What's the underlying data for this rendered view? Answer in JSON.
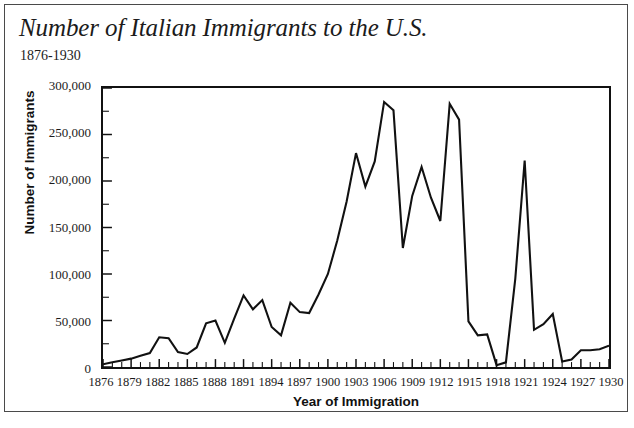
{
  "chart_data": {
    "type": "line",
    "title": "Number of Italian Immigrants to the U.S.",
    "subtitle": "1876-1930",
    "xlabel": "Year of Immigration",
    "ylabel": "Number of Immigrants",
    "xlim": [
      1876,
      1930
    ],
    "ylim": [
      0,
      300000
    ],
    "grid": false,
    "legend": null,
    "line_color": "#111111",
    "frame_color": "#111111",
    "background_color": "#ffffff",
    "y_ticks": [
      0,
      50000,
      100000,
      150000,
      200000,
      250000,
      300000
    ],
    "y_tick_labels": [
      "0",
      "50,000",
      "100,000",
      "150,000",
      "200,000",
      "250,000",
      "300,000"
    ],
    "y_minor_tick_interval": 25000,
    "x_tick_labels": [
      "1876",
      "1879",
      "1882",
      "1885",
      "1888",
      "1891",
      "1894",
      "1897",
      "1900",
      "1903",
      "1906",
      "1909",
      "1912",
      "1915",
      "1918",
      "1921",
      "1924",
      "1927",
      "1930"
    ],
    "x_tick_interval": 3,
    "x_minor_tick_interval": 1,
    "x": [
      1876,
      1877,
      1878,
      1879,
      1880,
      1881,
      1882,
      1883,
      1884,
      1885,
      1886,
      1887,
      1888,
      1889,
      1890,
      1891,
      1892,
      1893,
      1894,
      1895,
      1896,
      1897,
      1898,
      1899,
      1900,
      1901,
      1902,
      1903,
      1904,
      1905,
      1906,
      1907,
      1908,
      1909,
      1910,
      1911,
      1912,
      1913,
      1914,
      1915,
      1916,
      1917,
      1918,
      1919,
      1920,
      1921,
      1922,
      1923,
      1924,
      1925,
      1926,
      1927,
      1928,
      1929,
      1930
    ],
    "values": [
      3000,
      5000,
      7000,
      9000,
      12000,
      15000,
      32000,
      31000,
      16000,
      14000,
      21000,
      47000,
      50000,
      26000,
      52000,
      77000,
      62000,
      72000,
      43000,
      34000,
      69000,
      59000,
      58000,
      78000,
      100000,
      136000,
      178000,
      230000,
      194000,
      221000,
      285000,
      276000,
      128000,
      184000,
      215000,
      182000,
      157000,
      283000,
      266000,
      49000,
      34000,
      35000,
      2000,
      5000,
      95000,
      222000,
      40000,
      46000,
      57000,
      6000,
      8000,
      18000,
      18000,
      19000,
      23000
    ]
  }
}
